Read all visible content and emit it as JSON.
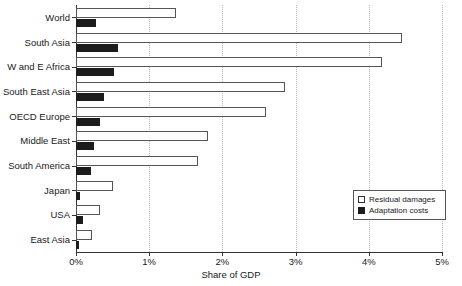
{
  "chart_data": {
    "type": "bar",
    "orientation": "horizontal",
    "title": "",
    "xlabel": "Share of GDP",
    "ylabel": "",
    "xlim": [
      0,
      5
    ],
    "xticks": [
      "0%",
      "1%",
      "2%",
      "3%",
      "4%",
      "5%"
    ],
    "xtick_values": [
      0,
      1,
      2,
      3,
      4,
      5
    ],
    "grid": "vertical-dotted",
    "legend_position": "lower-right",
    "categories": [
      "World",
      "South Asia",
      "W and E Africa",
      "South East Asia",
      "OECD Europe",
      "Middle East",
      "South America",
      "Japan",
      "USA",
      "East Asia"
    ],
    "series": [
      {
        "name": "Residual damages",
        "style": "open",
        "color": "#ffffff",
        "values": [
          1.36,
          4.46,
          4.18,
          2.85,
          2.6,
          1.8,
          1.67,
          0.5,
          0.33,
          0.22
        ]
      },
      {
        "name": "Adaptation costs",
        "style": "filled",
        "color": "#1c1c1c",
        "values": [
          0.28,
          0.58,
          0.52,
          0.38,
          0.33,
          0.25,
          0.2,
          0.06,
          0.1,
          0.04
        ]
      }
    ]
  },
  "legend": {
    "items": [
      {
        "label": "Residual damages",
        "swatch": "open-square"
      },
      {
        "label": "Adaptation costs",
        "swatch": "filled-square"
      }
    ]
  },
  "axis": {
    "x_title": "Share of GDP"
  },
  "colors": {
    "residual": "#ffffff",
    "adaptation": "#1c1c1c",
    "axis": "#333333",
    "grid": "#b9b9b9",
    "text": "#1a1a1a"
  }
}
